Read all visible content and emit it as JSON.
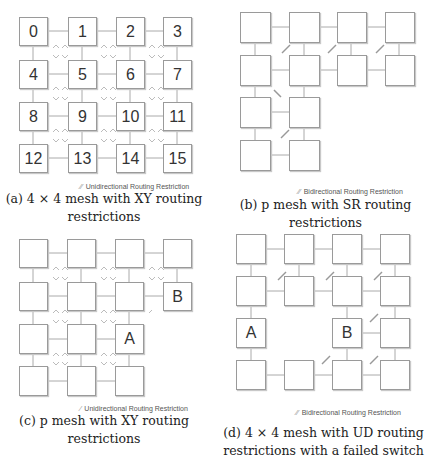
{
  "panels": [
    {
      "id": "a",
      "caption_line1": "(a) 4 × 4 mesh with XY routing",
      "caption_line2": "restrictions",
      "legend": "Unidirectional Routing Restriction",
      "legend_mark": "⁄⁄",
      "grid": {
        "cols": 4,
        "rows": 4
      },
      "nodes": [
        {
          "r": 0,
          "c": 0,
          "label": "0"
        },
        {
          "r": 0,
          "c": 1,
          "label": "1"
        },
        {
          "r": 0,
          "c": 2,
          "label": "2"
        },
        {
          "r": 0,
          "c": 3,
          "label": "3"
        },
        {
          "r": 1,
          "c": 0,
          "label": "4"
        },
        {
          "r": 1,
          "c": 1,
          "label": "5"
        },
        {
          "r": 1,
          "c": 2,
          "label": "6"
        },
        {
          "r": 1,
          "c": 3,
          "label": "7"
        },
        {
          "r": 2,
          "c": 0,
          "label": "8"
        },
        {
          "r": 2,
          "c": 1,
          "label": "9"
        },
        {
          "r": 2,
          "c": 2,
          "label": "10"
        },
        {
          "r": 2,
          "c": 3,
          "label": "11"
        },
        {
          "r": 3,
          "c": 0,
          "label": "12"
        },
        {
          "r": 3,
          "c": 1,
          "label": "13"
        },
        {
          "r": 3,
          "c": 2,
          "label": "14"
        },
        {
          "r": 3,
          "c": 3,
          "label": "15"
        }
      ],
      "restriction_type": "unidirectional"
    },
    {
      "id": "b",
      "caption_line1": "(b) p mesh with SR routing",
      "caption_line2": "restrictions",
      "legend": "Bidirectional Routing Restriction",
      "legend_mark": "⁄⁄",
      "grid": {
        "cols": 4,
        "rows": 4
      },
      "nodes": [
        {
          "r": 0,
          "c": 0,
          "label": ""
        },
        {
          "r": 0,
          "c": 1,
          "label": ""
        },
        {
          "r": 0,
          "c": 2,
          "label": ""
        },
        {
          "r": 0,
          "c": 3,
          "label": ""
        },
        {
          "r": 1,
          "c": 0,
          "label": ""
        },
        {
          "r": 1,
          "c": 1,
          "label": ""
        },
        {
          "r": 1,
          "c": 2,
          "label": ""
        },
        {
          "r": 1,
          "c": 3,
          "label": ""
        },
        {
          "r": 2,
          "c": 0,
          "label": ""
        },
        {
          "r": 2,
          "c": 1,
          "label": ""
        },
        {
          "r": 3,
          "c": 0,
          "label": ""
        },
        {
          "r": 3,
          "c": 1,
          "label": ""
        }
      ],
      "restriction_type": "bidirectional"
    },
    {
      "id": "c",
      "caption_line1": "(c) p mesh with XY routing",
      "caption_line2": "restrictions",
      "legend": "Unidirectional Routing Restriction",
      "legend_mark": "⁄",
      "grid": {
        "cols": 4,
        "rows": 4
      },
      "nodes": [
        {
          "r": 0,
          "c": 0,
          "label": ""
        },
        {
          "r": 0,
          "c": 1,
          "label": ""
        },
        {
          "r": 0,
          "c": 2,
          "label": ""
        },
        {
          "r": 0,
          "c": 3,
          "label": ""
        },
        {
          "r": 1,
          "c": 0,
          "label": ""
        },
        {
          "r": 1,
          "c": 1,
          "label": ""
        },
        {
          "r": 1,
          "c": 2,
          "label": ""
        },
        {
          "r": 1,
          "c": 3,
          "label": "B"
        },
        {
          "r": 2,
          "c": 0,
          "label": ""
        },
        {
          "r": 2,
          "c": 1,
          "label": ""
        },
        {
          "r": 2,
          "c": 2,
          "label": "A"
        },
        {
          "r": 3,
          "c": 0,
          "label": ""
        },
        {
          "r": 3,
          "c": 1,
          "label": ""
        },
        {
          "r": 3,
          "c": 2,
          "label": ""
        }
      ],
      "restriction_type": "unidirectional"
    },
    {
      "id": "d",
      "caption_line1": "(d) 4 × 4 mesh with UD routing",
      "caption_line2": "restrictions with a failed switch",
      "legend": "Bidirectional Routing Restriction",
      "legend_mark": "⁄⁄",
      "grid": {
        "cols": 4,
        "rows": 4
      },
      "nodes": [
        {
          "r": 0,
          "c": 0,
          "label": ""
        },
        {
          "r": 0,
          "c": 1,
          "label": ""
        },
        {
          "r": 0,
          "c": 2,
          "label": ""
        },
        {
          "r": 0,
          "c": 3,
          "label": ""
        },
        {
          "r": 1,
          "c": 0,
          "label": ""
        },
        {
          "r": 1,
          "c": 1,
          "label": ""
        },
        {
          "r": 1,
          "c": 2,
          "label": ""
        },
        {
          "r": 1,
          "c": 3,
          "label": ""
        },
        {
          "r": 2,
          "c": 0,
          "label": "A"
        },
        {
          "r": 2,
          "c": 2,
          "label": "B"
        },
        {
          "r": 2,
          "c": 3,
          "label": ""
        },
        {
          "r": 3,
          "c": 0,
          "label": ""
        },
        {
          "r": 3,
          "c": 1,
          "label": ""
        },
        {
          "r": 3,
          "c": 2,
          "label": ""
        },
        {
          "r": 3,
          "c": 3,
          "label": ""
        }
      ],
      "restriction_type": "bidirectional",
      "failed_switch": {
        "r": 2,
        "c": 1
      }
    }
  ]
}
